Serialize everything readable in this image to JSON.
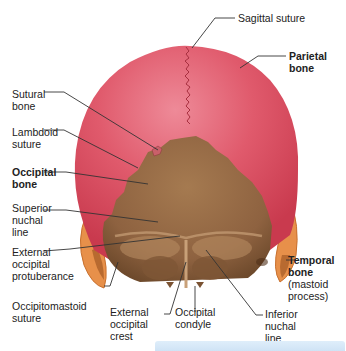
{
  "figure": {
    "view": "posterior view of skull",
    "colors": {
      "parietal": "#d94a5c",
      "parietal_highlight": "#ec8090",
      "occipital": "#9a6e46",
      "occipital_dark": "#7a5232",
      "temporal": "#e7904a",
      "leader_line": "#333333",
      "bar": "#d6e8f7"
    }
  },
  "labels": {
    "sagittal_suture": "Sagittal suture",
    "parietal_bone": "Parietal bone",
    "sutural_bone": "Sutural\nbone",
    "lambdoid_suture": "Lambdoid\nsuture",
    "occipital_bone": "Occipital\nbone",
    "superior_nuchal_line": "Superior\nnuchal\nline",
    "external_occipital_protuberance": "External\noccipital\nprotuberance",
    "occipitomastoid_suture": "Occipitomastoid\nsuture",
    "external_occipital_crest": "External\noccipital\ncrest",
    "occipital_condyle": "Occipital\ncondyle",
    "inferior_nuchal_line": "Inferior\nnuchal\nline",
    "temporal_bone": "Temporal\nbone",
    "temporal_bone_sub": "(mastoid\nprocess)"
  }
}
